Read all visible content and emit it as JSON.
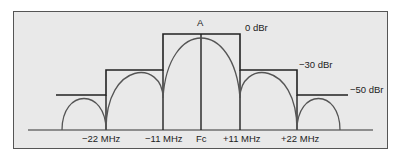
{
  "diagram": {
    "title_marker": "A",
    "mask_levels": [
      {
        "label": "0 dBr",
        "dbr": 0
      },
      {
        "label": "−30 dBr",
        "dbr": -30
      },
      {
        "label": "−50 dBr",
        "dbr": -50
      }
    ],
    "x_axis_labels": [
      "−22 MHz",
      "−11 MHz",
      "Fc",
      "+11 MHz",
      "+22 MHz"
    ],
    "colors": {
      "background": "#e9e9e9",
      "mask_line": "#222222",
      "spectrum_curve": "#555555",
      "border": "#555555"
    }
  },
  "labels": {
    "a": "A",
    "l0": "0 dBr",
    "l30": "−30 dBr",
    "l50": "−50 dBr",
    "xm22": "−22 MHz",
    "xm11": "−11 MHz",
    "xfc": "Fc",
    "xp11": "+11 MHz",
    "xp22": "+22 MHz"
  }
}
